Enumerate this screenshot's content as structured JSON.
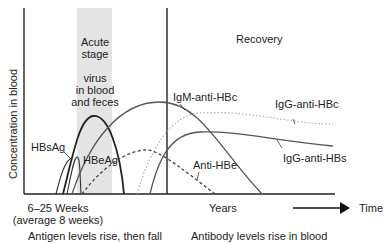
{
  "diagram": {
    "title_fragment": "",
    "y_axis_label": "Concentration in blood",
    "phases": {
      "acute": {
        "line1": "Acute",
        "line2": "stage",
        "line3": "virus",
        "line4": "in blood",
        "line5": "and feces"
      },
      "recovery": "Recovery"
    },
    "curves": {
      "hbsag": "HBsAg",
      "hbeag": "HBeAg",
      "igm_anti_hbc": "IgM-anti-HBc",
      "igg_anti_hbc": "IgG-anti-HBc",
      "igg_anti_hbs": "IgG-anti-HBs",
      "anti_hbe": "Anti-HBe"
    },
    "x_axis": {
      "incubation_line1": "6–25 Weeks",
      "incubation_line2": "(average 8 weeks)",
      "years": "Years",
      "time": "Time"
    },
    "captions": {
      "left": "Antigen levels rise, then fall",
      "right": "Antibody levels rise in blood"
    },
    "colors": {
      "acute_band": "#e4e4e4",
      "line": "#333333",
      "dotted_light": "#aaaaaa"
    }
  }
}
